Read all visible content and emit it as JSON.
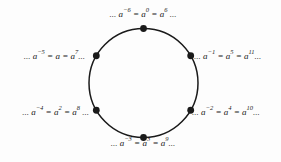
{
  "colors": {
    "background": "#fdfdfd",
    "ink": "#1a1a1a"
  },
  "diagram": {
    "circle": {
      "cx": 143.5,
      "cy": 83,
      "r": 54.5,
      "stroke_width": 1.5
    },
    "node_angles_deg": [
      90,
      150,
      210,
      270,
      330,
      30
    ],
    "node_dot_radius": 3.4,
    "labels": [
      {
        "id": "top",
        "text": "... a^-6 = a^0 = a^6 ..."
      },
      {
        "id": "upper-right",
        "text": "... a^-1 = a^5 = a^11..."
      },
      {
        "id": "lower-right",
        "text": "... a^-2 = a^4 = a^10..."
      },
      {
        "id": "bottom",
        "text": "... a^-3 = a^3 = a^9..."
      },
      {
        "id": "lower-left",
        "text": "... a^-4 = a^2 = a^8 ..."
      },
      {
        "id": "upper-left",
        "text": "... a^-5 = a = a^7..."
      }
    ]
  }
}
